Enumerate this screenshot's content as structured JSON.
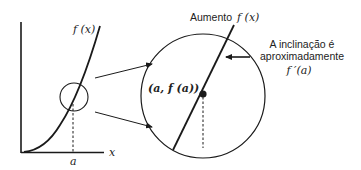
{
  "left_graph": {
    "curve_label": "f (x)",
    "x_axis_label": "x",
    "point_label": "a"
  },
  "zoomed_view": {
    "title_prefix": "Aumento",
    "title_function": "f (x)",
    "point_label": "(a, f (a))",
    "annotation_line1": "A inclinação é",
    "annotation_line2": "aproximadamente",
    "annotation_line3": "f ′(a)"
  },
  "colors": {
    "stroke": "#1a1a1a",
    "background": "#ffffff"
  }
}
